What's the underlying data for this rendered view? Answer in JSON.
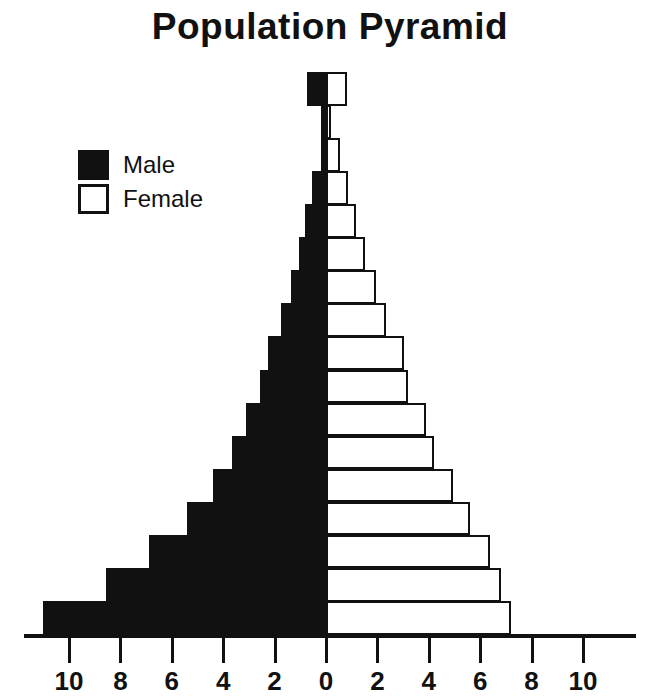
{
  "title": "Population Pyramid",
  "legend": {
    "items": [
      {
        "label": "Male",
        "swatch": "filled",
        "color": "#111111"
      },
      {
        "label": "Female",
        "swatch": "hollow",
        "color": "#ffffff"
      }
    ]
  },
  "axis": {
    "tick_labels": [
      "10",
      "8",
      "6",
      "4",
      "2",
      "0",
      "2",
      "4",
      "6",
      "8",
      "10"
    ],
    "tick_values": [
      -10,
      -8,
      -6,
      -4,
      -2,
      0,
      2,
      4,
      6,
      8,
      10
    ]
  },
  "chart_data": {
    "type": "bar",
    "subtype": "population-pyramid",
    "title": "Population Pyramid",
    "xlabel": "",
    "ylabel": "",
    "xlim": [
      -11.5,
      11.5
    ],
    "grid": false,
    "legend_position": "upper-left",
    "orientation": "horizontal",
    "categories": [
      "group-17",
      "group-16",
      "group-15",
      "group-14",
      "group-13",
      "group-12",
      "group-11",
      "group-10",
      "group-9",
      "group-8",
      "group-7",
      "group-6",
      "group-5",
      "group-4",
      "group-3",
      "group-2",
      "group-1"
    ],
    "series": [
      {
        "name": "Male",
        "color": "#111111",
        "values": [
          0.75,
          0.18,
          0.2,
          0.55,
          0.8,
          1.05,
          1.35,
          1.75,
          2.25,
          2.55,
          3.1,
          3.65,
          4.4,
          5.4,
          6.9,
          8.55,
          11.0
        ]
      },
      {
        "name": "Female",
        "color": "#ffffff",
        "values": [
          0.8,
          0.2,
          0.55,
          0.85,
          1.15,
          1.5,
          1.95,
          2.35,
          3.05,
          3.2,
          3.9,
          4.2,
          4.95,
          5.6,
          6.4,
          6.8,
          7.2
        ]
      }
    ]
  }
}
